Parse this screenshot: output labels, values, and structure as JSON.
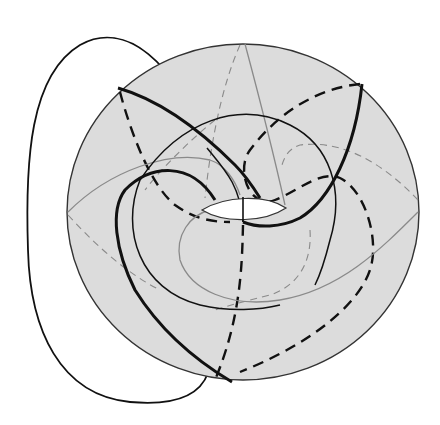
{
  "figure": {
    "title": "Knot on a torus",
    "colors": {
      "background": "#ffffff",
      "torus_fill": "#dcdcdc",
      "torus_outline": "#333333",
      "hole_fill": "#ffffff",
      "strand_dark": "#111111",
      "strand_gray": "#8a8a8a"
    }
  }
}
